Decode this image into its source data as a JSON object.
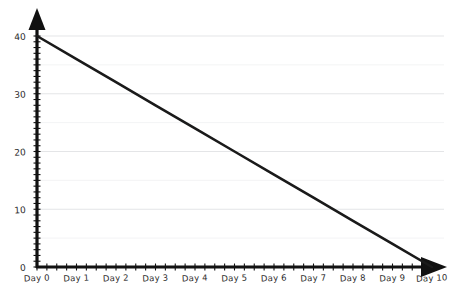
{
  "chart_data": {
    "type": "line",
    "title": "",
    "subtitle": "",
    "xlabel": "",
    "ylabel": "",
    "categories": [
      "Day 0",
      "Day 1",
      "Day 2",
      "Day 3",
      "Day 4",
      "Day 5",
      "Day 6",
      "Day 7",
      "Day 8",
      "Day 9",
      "Day 10"
    ],
    "x": [
      0,
      1,
      2,
      3,
      4,
      5,
      6,
      7,
      8,
      9,
      10
    ],
    "values": [
      40,
      36,
      32,
      28,
      24,
      20,
      16,
      12,
      8,
      4,
      0
    ],
    "series": [
      {
        "name": "Ideal burndown",
        "values": [
          40,
          36,
          32,
          28,
          24,
          20,
          16,
          12,
          8,
          4,
          0
        ],
        "color": "#1a1a1a"
      }
    ],
    "xlim": [
      0,
      10
    ],
    "ylim": [
      0,
      40
    ],
    "ytick_labels": [
      "0",
      "10",
      "20",
      "30",
      "40"
    ],
    "ytick_values": [
      0,
      10,
      20,
      30,
      40
    ],
    "gridlines_y": [
      5,
      10,
      15,
      20,
      25,
      30,
      35,
      40
    ],
    "gridline_major_values": [
      10,
      20,
      30,
      40
    ],
    "gridline_minor_values": [
      5,
      15,
      25,
      35
    ],
    "grid": true,
    "legend": false,
    "legend_position": "none",
    "annotations": [],
    "style": "hand-drawn-sketch",
    "axis_arrows": true,
    "colors": {
      "line": "#1a1a1a",
      "axis": "#111111",
      "grid_major": "#d8dadd",
      "grid_minor": "#ebedef",
      "background": "#ffffff",
      "text": "#2b2b2b"
    }
  },
  "axes": {
    "y": {
      "labels": [
        {
          "text": "40",
          "value": 40
        },
        {
          "text": "30",
          "value": 30
        },
        {
          "text": "20",
          "value": 20
        },
        {
          "text": "10",
          "value": 10
        },
        {
          "text": "0",
          "value": 0
        }
      ]
    },
    "x": {
      "labels": [
        {
          "text": "Day 0",
          "value": 0
        },
        {
          "text": "Day 1",
          "value": 1
        },
        {
          "text": "Day 2",
          "value": 2
        },
        {
          "text": "Day 3",
          "value": 3
        },
        {
          "text": "Day 4",
          "value": 4
        },
        {
          "text": "Day 5",
          "value": 5
        },
        {
          "text": "Day 6",
          "value": 6
        },
        {
          "text": "Day 7",
          "value": 7
        },
        {
          "text": "Day 8",
          "value": 8
        },
        {
          "text": "Day 9",
          "value": 9
        },
        {
          "text": "Day 10",
          "value": 10
        }
      ]
    }
  }
}
